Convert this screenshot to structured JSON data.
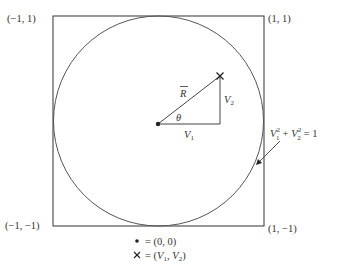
{
  "diagram": {
    "corners": {
      "top_left": "(−1, 1)",
      "top_right": "(1, 1)",
      "bottom_left": "(−1, −1)",
      "bottom_right": "(1, −1)"
    },
    "vector_label": "R",
    "angle_label": "θ",
    "horizontal_leg_label": {
      "base": "V",
      "sub": "1"
    },
    "vertical_leg_label": {
      "base": "V",
      "sub": "2"
    },
    "equation": {
      "term1_base": "V",
      "term1_sub": "1",
      "term1_sup": "2",
      "plus": "+",
      "term2_base": "V",
      "term2_sub": "2",
      "term2_sup": "2",
      "rhs": "= 1"
    },
    "legend": [
      {
        "symbol": "•",
        "text": "= (0, 0)"
      },
      {
        "symbol": "×",
        "text_prefix": "= (",
        "v1": "V",
        "v1_sub": "1",
        "sep": ", ",
        "v2": "V",
        "v2_sub": "2",
        "text_suffix": ")"
      }
    ],
    "colors": {
      "stroke": "#444444",
      "text": "#333333"
    }
  }
}
